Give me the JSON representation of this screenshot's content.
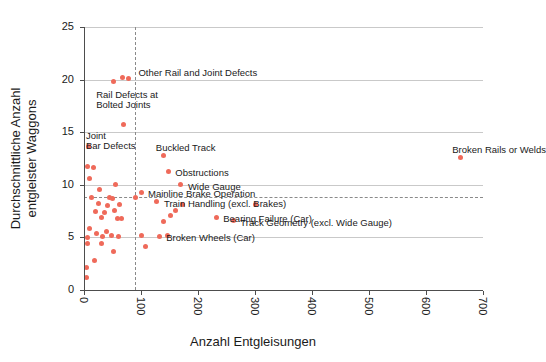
{
  "chart_data": {
    "type": "scatter",
    "title": "",
    "xlabel": "Anzahl Entgleisungen",
    "ylabel": "Durchschnittliche Anzahl\nentgleister Waggons",
    "ylabel_line1": "Durchschnittliche Anzahl",
    "ylabel_line2": "entgleister Waggons",
    "xlim": [
      0,
      700
    ],
    "ylim": [
      0,
      25
    ],
    "xticks": [
      "0",
      "100",
      "200",
      "300",
      "400",
      "500",
      "600",
      "700"
    ],
    "yticks": [
      "0",
      "5",
      "10",
      "15",
      "20",
      "25"
    ],
    "xtick_values": [
      0,
      100,
      200,
      300,
      400,
      500,
      600,
      700
    ],
    "ytick_values": [
      0,
      5,
      10,
      15,
      20,
      25
    ],
    "grid": "horizontal",
    "legend": "none",
    "point_color": "#ef6a5a",
    "reference_lines": [
      {
        "orientation": "vertical",
        "value": 90,
        "style": "dashed",
        "color": "#8a8a8a"
      },
      {
        "orientation": "horizontal",
        "value": 8.8,
        "style": "dashed",
        "color": "#8a8a8a"
      }
    ],
    "labeled_points": [
      {
        "label": "Other Rail and Joint Defects",
        "x": 78,
        "y": 20.1,
        "label_dx": 10,
        "label_dy": -12,
        "align": "left"
      },
      {
        "label": "Rail Defects at\nBolted Joints",
        "x": 60,
        "y": 19.8,
        "label_dx": -22,
        "label_dy": 8,
        "align": "left"
      },
      {
        "label": "Joint\nBar Defects",
        "x": 70,
        "y": 15.7,
        "label_dx": -38,
        "label_dy": 6,
        "align": "left"
      },
      {
        "label": "Buckled Track",
        "x": 140,
        "y": 12.8,
        "label_dx": -8,
        "label_dy": -13,
        "align": "left"
      },
      {
        "label": "Obstructions",
        "x": 148,
        "y": 11.3,
        "label_dx": 7,
        "label_dy": -4,
        "align": "left"
      },
      {
        "label": "Wide Gauge",
        "x": 170,
        "y": 10.0,
        "label_dx": 7,
        "label_dy": -4,
        "align": "left"
      },
      {
        "label": "Mainline Brake Operation",
        "x": 100,
        "y": 9.3,
        "label_dx": 7,
        "label_dy": -4,
        "align": "left"
      },
      {
        "label": "Train Handling (excl. Brakes)",
        "x": 128,
        "y": 8.4,
        "label_dx": 7,
        "label_dy": -4,
        "align": "left"
      },
      {
        "label": "Bearing Failure (Car)",
        "x": 232,
        "y": 6.9,
        "label_dx": 7,
        "label_dy": -4,
        "align": "left"
      },
      {
        "label": "Track Geometry (excl. Wide Gauge)",
        "x": 262,
        "y": 6.6,
        "label_dx": 7,
        "label_dy": -4,
        "align": "left"
      },
      {
        "label": "Broken Wheels (Car)",
        "x": 132,
        "y": 5.1,
        "label_dx": 7,
        "label_dy": -4,
        "align": "left"
      },
      {
        "label": "Broken Rails or Welds",
        "x": 660,
        "y": 12.6,
        "label_dx": -8,
        "label_dy": -13,
        "align": "left"
      }
    ],
    "points": [
      {
        "x": 78,
        "y": 20.1
      },
      {
        "x": 68,
        "y": 20.2
      },
      {
        "x": 52,
        "y": 19.8
      },
      {
        "x": 70,
        "y": 15.7
      },
      {
        "x": 8,
        "y": 13.6
      },
      {
        "x": 6,
        "y": 11.7
      },
      {
        "x": 17,
        "y": 11.6
      },
      {
        "x": 10,
        "y": 10.6
      },
      {
        "x": 55,
        "y": 10.0
      },
      {
        "x": 28,
        "y": 9.6
      },
      {
        "x": 100,
        "y": 9.3
      },
      {
        "x": 140,
        "y": 12.8
      },
      {
        "x": 148,
        "y": 11.3
      },
      {
        "x": 170,
        "y": 10.0
      },
      {
        "x": 14,
        "y": 8.8
      },
      {
        "x": 44,
        "y": 8.8
      },
      {
        "x": 50,
        "y": 8.7
      },
      {
        "x": 90,
        "y": 8.8
      },
      {
        "x": 26,
        "y": 8.2
      },
      {
        "x": 42,
        "y": 8.0
      },
      {
        "x": 62,
        "y": 8.1
      },
      {
        "x": 128,
        "y": 8.4
      },
      {
        "x": 172,
        "y": 8.1
      },
      {
        "x": 300,
        "y": 8.1
      },
      {
        "x": 20,
        "y": 7.5
      },
      {
        "x": 36,
        "y": 7.4
      },
      {
        "x": 54,
        "y": 7.6
      },
      {
        "x": 160,
        "y": 7.6
      },
      {
        "x": 30,
        "y": 6.9
      },
      {
        "x": 58,
        "y": 6.8
      },
      {
        "x": 66,
        "y": 6.8
      },
      {
        "x": 232,
        "y": 6.9
      },
      {
        "x": 262,
        "y": 6.6
      },
      {
        "x": 140,
        "y": 6.5
      },
      {
        "x": 152,
        "y": 7.1
      },
      {
        "x": 10,
        "y": 5.8
      },
      {
        "x": 22,
        "y": 5.4
      },
      {
        "x": 40,
        "y": 5.6
      },
      {
        "x": 48,
        "y": 5.2
      },
      {
        "x": 6,
        "y": 5.0
      },
      {
        "x": 32,
        "y": 5.1
      },
      {
        "x": 60,
        "y": 5.1
      },
      {
        "x": 100,
        "y": 5.2
      },
      {
        "x": 132,
        "y": 5.1
      },
      {
        "x": 146,
        "y": 5.2
      },
      {
        "x": 6,
        "y": 4.4
      },
      {
        "x": 30,
        "y": 4.4
      },
      {
        "x": 52,
        "y": 3.7
      },
      {
        "x": 108,
        "y": 4.1
      },
      {
        "x": 18,
        "y": 2.8
      },
      {
        "x": 5,
        "y": 2.1
      },
      {
        "x": 5,
        "y": 1.2
      },
      {
        "x": 660,
        "y": 12.6
      }
    ]
  }
}
